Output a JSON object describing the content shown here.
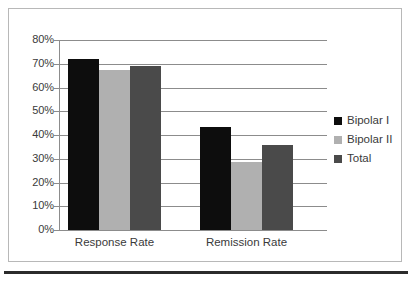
{
  "chart_data": {
    "type": "bar",
    "title": "",
    "subtitle": "",
    "xlabel": "",
    "ylabel": "",
    "categories": [
      "Response Rate",
      "Remission Rate"
    ],
    "series": [
      {
        "name": "Bipolar I",
        "color": "#0d0d0d",
        "values": [
          72,
          43.5
        ]
      },
      {
        "name": "Bipolar II",
        "color": "#b0b0b0",
        "values": [
          67.5,
          28.5
        ]
      },
      {
        "name": "Total",
        "color": "#4a4a4a",
        "values": [
          69,
          36
        ]
      }
    ],
    "ylim": [
      0,
      80
    ],
    "ytick_step": 10,
    "ytick_labels": [
      "80%",
      "70%",
      "60%",
      "50%",
      "40%",
      "30%",
      "20%",
      "10%",
      "0%"
    ],
    "ytick_values": [
      80,
      70,
      60,
      50,
      40,
      30,
      20,
      10,
      0
    ],
    "grid": true,
    "grid_axis": "y",
    "legend_position": "right",
    "value_format": "percent"
  },
  "frame": {
    "border_color": "#b8b8b8",
    "rule_color": "#2b2b2b",
    "background": "#ffffff",
    "grid_color": "#8c8c8c",
    "text_color": "#3a3a3a"
  }
}
